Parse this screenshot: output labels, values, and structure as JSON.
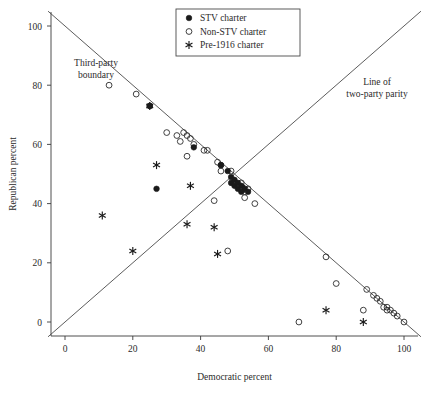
{
  "figure": {
    "background_color": "#ffffff",
    "ink_color": "#231f20"
  },
  "axes": {
    "xlabel": "Democratic percent",
    "ylabel": "Republican percent",
    "xticks": [
      0,
      20,
      40,
      60,
      80,
      100
    ],
    "yticks": [
      0,
      20,
      40,
      60,
      80,
      100
    ],
    "xlim": [
      -8,
      108
    ],
    "ylim": [
      -8,
      108
    ],
    "grid": false
  },
  "legend": {
    "position": "top-center",
    "entries": [
      {
        "label": "STV charter",
        "marker": "filled-circle"
      },
      {
        "label": "Non-STV charter",
        "marker": "open-circle"
      },
      {
        "label": "Pre-1916 charter",
        "marker": "asterisk"
      }
    ]
  },
  "annotations": [
    {
      "name": "third-party-boundary",
      "line1": "Third-party",
      "line2": "boundary"
    },
    {
      "name": "line-of-two-party-parity",
      "line1": "Line of",
      "line2": "two-party parity"
    }
  ],
  "reference_lines": [
    {
      "name": "third-party-boundary-line",
      "description": "x + y = 100",
      "from": [
        -5,
        105
      ],
      "to": [
        105,
        -5
      ]
    },
    {
      "name": "two-party-parity-line",
      "description": "y = x",
      "from": [
        -5,
        -5
      ],
      "to": [
        105,
        105
      ]
    }
  ],
  "chart_data": {
    "type": "scatter",
    "title": "",
    "xlabel": "Democratic percent",
    "ylabel": "Republican percent",
    "xlim": [
      -8,
      108
    ],
    "ylim": [
      -8,
      108
    ],
    "grid": false,
    "legend_position": "top-center",
    "series": [
      {
        "name": "STV charter",
        "marker": "filled-circle",
        "color": "#1a1a1a",
        "points": [
          [
            25,
            73
          ],
          [
            27,
            45
          ],
          [
            38,
            59
          ],
          [
            46,
            53
          ],
          [
            48,
            51
          ],
          [
            49,
            49
          ],
          [
            49,
            47
          ],
          [
            50,
            48
          ],
          [
            50,
            46
          ],
          [
            51,
            47
          ],
          [
            51,
            45
          ],
          [
            52,
            46
          ],
          [
            52,
            44
          ],
          [
            53,
            45
          ],
          [
            54,
            44
          ]
        ]
      },
      {
        "name": "Non-STV charter",
        "marker": "open-circle",
        "color": "#2b2b2b",
        "points": [
          [
            13,
            80
          ],
          [
            21,
            77
          ],
          [
            25,
            73
          ],
          [
            30,
            64
          ],
          [
            33,
            63
          ],
          [
            34,
            61
          ],
          [
            35,
            64
          ],
          [
            36,
            63
          ],
          [
            36,
            56
          ],
          [
            37,
            62
          ],
          [
            38,
            60
          ],
          [
            41,
            58
          ],
          [
            42,
            58
          ],
          [
            44,
            41
          ],
          [
            45,
            54
          ],
          [
            46,
            53
          ],
          [
            46,
            51
          ],
          [
            48,
            24
          ],
          [
            49,
            51
          ],
          [
            52,
            47
          ],
          [
            53,
            44
          ],
          [
            53,
            42
          ],
          [
            54,
            45
          ],
          [
            56,
            40
          ],
          [
            69,
            0
          ],
          [
            77,
            22
          ],
          [
            80,
            13
          ],
          [
            88,
            4
          ],
          [
            89,
            11
          ],
          [
            91,
            9
          ],
          [
            92,
            8
          ],
          [
            93,
            7
          ],
          [
            94,
            5
          ],
          [
            95,
            5
          ],
          [
            95,
            4
          ],
          [
            96,
            4
          ],
          [
            97,
            3
          ],
          [
            98,
            2
          ],
          [
            100,
            0
          ]
        ]
      },
      {
        "name": "Pre-1916 charter",
        "marker": "asterisk",
        "color": "#1a1a1a",
        "points": [
          [
            25,
            73
          ],
          [
            11,
            36
          ],
          [
            20,
            24
          ],
          [
            27,
            53
          ],
          [
            36,
            33
          ],
          [
            37,
            46
          ],
          [
            44,
            32
          ],
          [
            45,
            23
          ],
          [
            53,
            45
          ],
          [
            77,
            4
          ],
          [
            88,
            0
          ]
        ]
      }
    ]
  }
}
